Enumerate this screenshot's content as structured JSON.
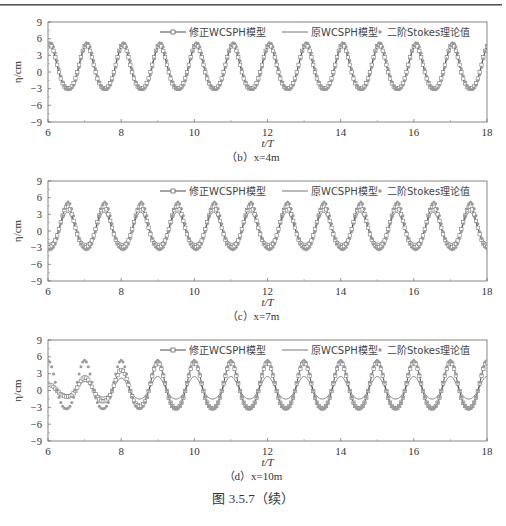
{
  "figure_caption": "图 3.5.7（续）",
  "chart_data": [
    {
      "type": "line",
      "panel_caption": "（b）x=4m",
      "xlabel": "t/T",
      "ylabel": "η/cm",
      "xlim": [
        6,
        18
      ],
      "ylim": [
        -9,
        9
      ],
      "xticks": [
        "6",
        "8",
        "10",
        "12",
        "14",
        "16",
        "18"
      ],
      "yticks": [
        "9",
        "6",
        "3",
        "0",
        "-3",
        "-6",
        "-9"
      ],
      "legend": [
        "修正WCSPH模型",
        "原WCSPH模型",
        "二阶Stokes理论值"
      ],
      "legend_position": "top",
      "grid": false,
      "series": [
        {
          "name": "修正WCSPH模型",
          "style": "line-open-square",
          "crest": 4.9,
          "trough": -4.0,
          "phase": 0.05,
          "period": 1
        },
        {
          "name": "原WCSPH模型",
          "style": "line",
          "crest": 4.6,
          "trough": -3.8,
          "phase": 0.05,
          "period": 1
        },
        {
          "name": "二阶Stokes理论值",
          "style": "dot",
          "crest": 5.3,
          "trough": -4.2,
          "phase": 0.07,
          "period": 1
        }
      ]
    },
    {
      "type": "line",
      "panel_caption": "（c）x=7m",
      "xlabel": "t/T",
      "ylabel": "η/cm",
      "xlim": [
        6,
        18
      ],
      "ylim": [
        -9,
        9
      ],
      "xticks": [
        "6",
        "8",
        "10",
        "12",
        "14",
        "16",
        "18"
      ],
      "yticks": [
        "9",
        "6",
        "3",
        "0",
        "-3",
        "-6",
        "-9"
      ],
      "legend": [
        "修正WCSPH模型",
        "原WCSPH模型",
        "二阶Stokes理论值"
      ],
      "legend_position": "top",
      "grid": false,
      "series": [
        {
          "name": "修正WCSPH模型",
          "style": "line-open-square",
          "crest": 4.4,
          "trough": -3.8,
          "phase": 0.53,
          "period": 1
        },
        {
          "name": "原WCSPH模型",
          "style": "line",
          "crest": 3.4,
          "trough": -2.9,
          "phase": 0.53,
          "period": 1
        },
        {
          "name": "二阶Stokes理论值",
          "style": "dot",
          "crest": 5.2,
          "trough": -4.4,
          "phase": 0.55,
          "period": 1
        }
      ]
    },
    {
      "type": "line",
      "panel_caption": "（d）x=10m",
      "xlabel": "t/T",
      "ylabel": "η/cm",
      "xlim": [
        6,
        18
      ],
      "ylim": [
        -9,
        9
      ],
      "xticks": [
        "6",
        "8",
        "10",
        "12",
        "14",
        "16",
        "18"
      ],
      "yticks": [
        "9",
        "6",
        "3",
        "0",
        "-3",
        "-6",
        "-9"
      ],
      "legend": [
        "修正WCSPH模型",
        "原WCSPH模型",
        "二阶Stokes理论值"
      ],
      "legend_position": "top",
      "grid": false,
      "series": [
        {
          "name": "修正WCSPH模型",
          "style": "line-open-square",
          "crest": 5.0,
          "trough": -4.2,
          "phase": 0.0,
          "period": 1,
          "ramp_end": 9.0,
          "ramp_start_amp": 0.2
        },
        {
          "name": "原WCSPH模型",
          "style": "line",
          "crest": 2.5,
          "trough": -2.0,
          "phase": 0.0,
          "period": 1,
          "ramp_end": 8.5,
          "ramp_start_amp": 0.4
        },
        {
          "name": "二阶Stokes理论值",
          "style": "dot",
          "crest": 5.4,
          "trough": -4.3,
          "phase": 0.0,
          "period": 1
        }
      ]
    }
  ]
}
